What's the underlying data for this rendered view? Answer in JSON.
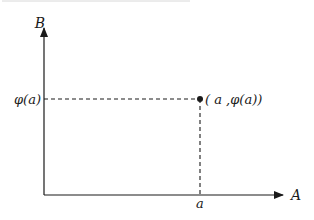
{
  "diagram": {
    "axes": {
      "x_label": "A",
      "y_label": "B"
    },
    "point": {
      "x_tick_label": "a",
      "y_tick_label": "φ(a)",
      "point_label": "( a ,φ(a))"
    },
    "colors": {
      "ink": "#1a1a1a",
      "background": "#ffffff"
    }
  }
}
